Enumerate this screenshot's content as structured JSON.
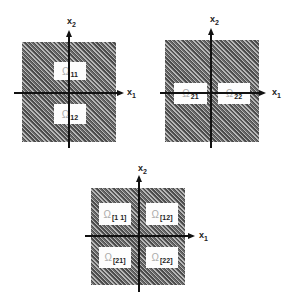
{
  "figure": {
    "panels": [
      {
        "id": "top-left",
        "axis_x_label": "x",
        "axis_x_sub": "1",
        "axis_y_label": "x",
        "axis_y_sub": "2",
        "regions": [
          {
            "symbol": "Ω",
            "subscript": "11"
          },
          {
            "symbol": "Ω",
            "subscript": "12"
          }
        ]
      },
      {
        "id": "top-right",
        "axis_x_label": "x",
        "axis_x_sub": "1",
        "axis_y_label": "x",
        "axis_y_sub": "2",
        "regions": [
          {
            "symbol": "Ω",
            "subscript": "21"
          },
          {
            "symbol": "Ω",
            "subscript": "22"
          }
        ]
      },
      {
        "id": "bottom",
        "axis_x_label": "x",
        "axis_x_sub": "1",
        "axis_y_label": "x",
        "axis_y_sub": "2",
        "regions": [
          {
            "symbol": "Ω",
            "subscript": "[1 1]"
          },
          {
            "symbol": "Ω",
            "subscript": "[12]"
          },
          {
            "symbol": "Ω",
            "subscript": "[21]"
          },
          {
            "symbol": "Ω",
            "subscript": "[22]"
          }
        ]
      }
    ],
    "colors": {
      "hatch_dark": "#4a4a4a",
      "hatch_light": "#b8b8b8",
      "axis": "#111111",
      "region_fill": "#fdfdfd"
    }
  }
}
